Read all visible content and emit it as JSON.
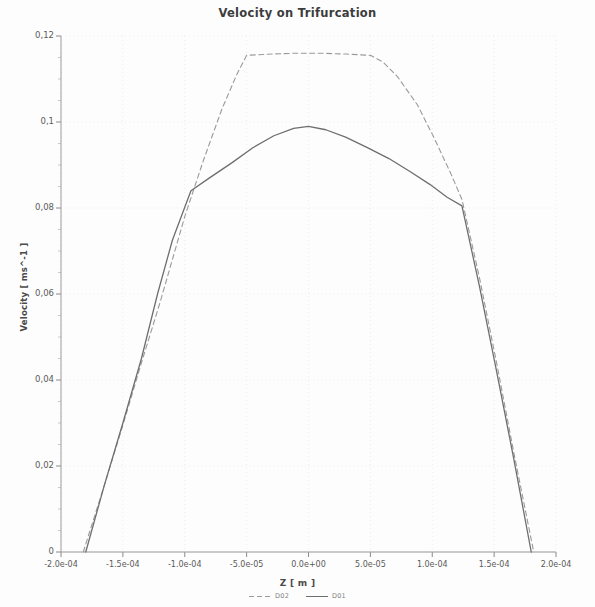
{
  "chart_data": {
    "type": "line",
    "title": "Velocity on Trifurcation",
    "xlabel": "Z [ m ]",
    "ylabel": "Velocity [ ms^-1 ]",
    "xlim": [
      -0.0002,
      0.0002
    ],
    "ylim": [
      0,
      0.12
    ],
    "grid": true,
    "legend_position": "bottom",
    "x_tick_labels": [
      "-2.0e-04",
      "-1.5e-04",
      "-1.0e-04",
      "-5.0e-05",
      "0.0e+00",
      "5.0e-05",
      "1.0e-04",
      "1.5e-04",
      "2.0e-04"
    ],
    "x_tick_values": [
      -0.0002,
      -0.00015,
      -0.0001,
      -5e-05,
      0,
      5e-05,
      0.0001,
      0.00015,
      0.0002
    ],
    "y_tick_labels": [
      "0",
      "0,02",
      "0,04",
      "0,06",
      "0,08",
      "0,1",
      "0,12"
    ],
    "y_tick_values": [
      0,
      0.02,
      0.04,
      0.06,
      0.08,
      0.1,
      0.12
    ],
    "series": [
      {
        "name": "D02",
        "style": "dashed",
        "color": "#9a9a9a",
        "x": [
          -0.000182,
          -0.000165,
          -0.00015,
          -0.000135,
          -0.00012,
          -0.00011,
          -0.0001,
          -8.5e-05,
          -7e-05,
          -5.8e-05,
          -5e-05,
          -3e-05,
          -1e-05,
          0.0,
          1e-05,
          3e-05,
          5e-05,
          6e-05,
          7.2e-05,
          8.8e-05,
          0.000102,
          0.000115,
          0.000124,
          0.000138,
          0.000152,
          0.000166,
          0.000182
        ],
        "y": [
          0.0,
          0.0155,
          0.0295,
          0.044,
          0.058,
          0.068,
          0.078,
          0.091,
          0.103,
          0.111,
          0.1155,
          0.1158,
          0.116,
          0.116,
          0.116,
          0.1158,
          0.1155,
          0.114,
          0.1105,
          0.104,
          0.096,
          0.088,
          0.082,
          0.064,
          0.044,
          0.023,
          0.0
        ]
      },
      {
        "name": "D01",
        "style": "solid",
        "color": "#6e6e6e",
        "x": [
          -0.00018,
          -0.000165,
          -0.00015,
          -0.000135,
          -0.000122,
          -0.00011,
          -9.5e-05,
          -8e-05,
          -6.2e-05,
          -4.5e-05,
          -2.8e-05,
          -1.2e-05,
          0.0,
          1.4e-05,
          3e-05,
          4.8e-05,
          6.5e-05,
          8.2e-05,
          9.8e-05,
          0.000112,
          0.000124,
          0.000138,
          0.000152,
          0.000166,
          0.00018
        ],
        "y": [
          0.0,
          0.0155,
          0.03,
          0.045,
          0.06,
          0.0725,
          0.084,
          0.087,
          0.0905,
          0.094,
          0.0968,
          0.0985,
          0.099,
          0.0982,
          0.0965,
          0.094,
          0.0915,
          0.0885,
          0.0855,
          0.0825,
          0.0805,
          0.062,
          0.042,
          0.0215,
          0.0
        ]
      }
    ]
  },
  "legend": {
    "entries": [
      {
        "label": "D02"
      },
      {
        "label": "D01"
      }
    ]
  }
}
